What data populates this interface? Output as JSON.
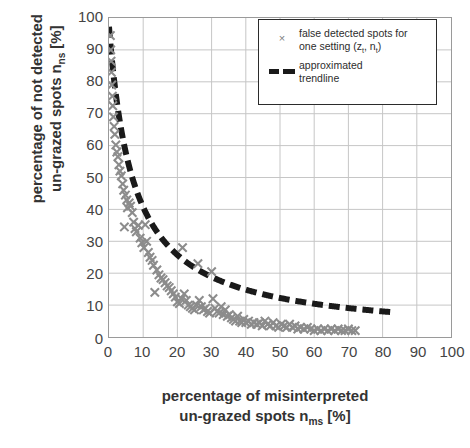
{
  "chart_data": {
    "type": "scatter",
    "title": "",
    "xlabel": "percentage of misinterpreted un-grazed spots n_ms [%]",
    "ylabel": "percentage of not detected un-grazed spots n_ns [%]",
    "xlim": [
      0,
      100
    ],
    "ylim": [
      0,
      100
    ],
    "xticks": [
      0,
      10,
      20,
      30,
      40,
      50,
      60,
      70,
      80,
      90,
      100
    ],
    "yticks": [
      0,
      10,
      20,
      30,
      40,
      50,
      60,
      70,
      80,
      90,
      100
    ],
    "grid": true,
    "legend_position": "top-right",
    "series": [
      {
        "name": "false detected spots for one setting (z_t, n_t)",
        "marker": "x",
        "color": "#8c8c8c",
        "points": [
          [
            0.4,
            94.5
          ],
          [
            0.5,
            90.0
          ],
          [
            0.6,
            86.5
          ],
          [
            0.7,
            83.0
          ],
          [
            0.8,
            79.0
          ],
          [
            1.0,
            75.5
          ],
          [
            1.1,
            72.5
          ],
          [
            1.3,
            69.0
          ],
          [
            1.5,
            66.0
          ],
          [
            1.7,
            63.5
          ],
          [
            2.0,
            60.2
          ],
          [
            2.3,
            58.0
          ],
          [
            2.6,
            56.5
          ],
          [
            2.9,
            54.0
          ],
          [
            3.2,
            52.0
          ],
          [
            3.6,
            50.5
          ],
          [
            4.0,
            48.0
          ],
          [
            4.3,
            46.0
          ],
          [
            4.8,
            44.5
          ],
          [
            5.2,
            43.0
          ],
          [
            5.4,
            40.5
          ],
          [
            5.9,
            42.0
          ],
          [
            6.3,
            41.0
          ],
          [
            6.8,
            39.0
          ],
          [
            4.5,
            34.5
          ],
          [
            7.2,
            36.0
          ],
          [
            7.6,
            34.0
          ],
          [
            8.0,
            33.0
          ],
          [
            8.6,
            35.0
          ],
          [
            9.1,
            31.0
          ],
          [
            9.6,
            29.5
          ],
          [
            10.2,
            28.0
          ],
          [
            10.6,
            35.2
          ],
          [
            11.0,
            30.0
          ],
          [
            11.5,
            26.5
          ],
          [
            12.0,
            25.0
          ],
          [
            12.6,
            24.0
          ],
          [
            13.0,
            22.5
          ],
          [
            13.4,
            14.0
          ],
          [
            14.0,
            21.0
          ],
          [
            14.6,
            19.5
          ],
          [
            15.2,
            18.5
          ],
          [
            15.8,
            18.0
          ],
          [
            16.4,
            17.0
          ],
          [
            17.0,
            16.0
          ],
          [
            17.6,
            15.5
          ],
          [
            18.2,
            14.5
          ],
          [
            18.8,
            13.5
          ],
          [
            19.4,
            12.5
          ],
          [
            20.0,
            11.0
          ],
          [
            20.6,
            10.5
          ],
          [
            21.2,
            12.0
          ],
          [
            21.5,
            28.0
          ],
          [
            22.0,
            13.5
          ],
          [
            22.6,
            11.5
          ],
          [
            23.2,
            10.0
          ],
          [
            23.8,
            9.5
          ],
          [
            24.4,
            9.0
          ],
          [
            25.0,
            8.5
          ],
          [
            25.6,
            10.0
          ],
          [
            26.0,
            23.0
          ],
          [
            26.4,
            11.5
          ],
          [
            27.0,
            9.5
          ],
          [
            27.6,
            8.5
          ],
          [
            28.2,
            9.0
          ],
          [
            28.8,
            8.0
          ],
          [
            29.4,
            7.5
          ],
          [
            30.0,
            20.5
          ],
          [
            30.4,
            12.0
          ],
          [
            31.0,
            9.0
          ],
          [
            31.6,
            8.0
          ],
          [
            32.2,
            7.5
          ],
          [
            32.8,
            9.5
          ],
          [
            33.4,
            7.0
          ],
          [
            34.0,
            8.5
          ],
          [
            34.6,
            6.5
          ],
          [
            35.2,
            7.0
          ],
          [
            35.8,
            6.0
          ],
          [
            36.4,
            5.5
          ],
          [
            37.0,
            5.0
          ],
          [
            37.6,
            6.5
          ],
          [
            38.2,
            5.0
          ],
          [
            38.8,
            4.5
          ],
          [
            39.4,
            5.5
          ],
          [
            40.0,
            4.5
          ],
          [
            40.8,
            5.0
          ],
          [
            41.6,
            4.0
          ],
          [
            42.4,
            4.5
          ],
          [
            43.2,
            4.0
          ],
          [
            44.0,
            4.5
          ],
          [
            44.8,
            3.5
          ],
          [
            45.6,
            5.0
          ],
          [
            46.4,
            4.0
          ],
          [
            47.2,
            3.5
          ],
          [
            48.0,
            4.5
          ],
          [
            48.8,
            3.5
          ],
          [
            49.6,
            3.0
          ],
          [
            50.4,
            4.0
          ],
          [
            51.2,
            3.5
          ],
          [
            52.0,
            3.0
          ],
          [
            52.8,
            4.0
          ],
          [
            53.6,
            3.0
          ],
          [
            54.4,
            3.5
          ],
          [
            55.2,
            2.5
          ],
          [
            56.0,
            3.0
          ],
          [
            57.0,
            2.5
          ],
          [
            58.0,
            3.0
          ],
          [
            59.0,
            2.5
          ],
          [
            60.0,
            2.0
          ],
          [
            61.0,
            2.5
          ],
          [
            62.0,
            2.0
          ],
          [
            63.0,
            2.5
          ],
          [
            64.0,
            2.0
          ],
          [
            65.0,
            2.5
          ],
          [
            66.0,
            2.0
          ],
          [
            67.0,
            2.5
          ],
          [
            68.0,
            2.0
          ],
          [
            69.0,
            2.0
          ],
          [
            70.0,
            2.5
          ],
          [
            71.0,
            2.0
          ],
          [
            72.0,
            2.0
          ]
        ]
      }
    ],
    "trendline": {
      "name": "approximated trendline",
      "style": "dashed",
      "color": "#1a1a1a",
      "formula": "y = 700 / (x + 7.2)",
      "x_range": [
        0,
        83
      ]
    }
  },
  "axis": {
    "y_title_line1": "percentage of not detected",
    "y_title_line2_pre": "un-grazed spots n",
    "y_title_line2_sub": "ns",
    "y_title_line2_post": " [%]",
    "x_title_line1": "percentage of misinterpreted",
    "x_title_line2_pre": "un-grazed spots n",
    "x_title_line2_sub": "ms",
    "x_title_line2_post": " [%]"
  },
  "legend": {
    "entries": [
      {
        "symbol": "×",
        "symbol_name": "x-marker",
        "line1": "false detected spots for",
        "line2_pre": "one setting (z",
        "line2_sub1": "t",
        "line2_mid": ", n",
        "line2_sub2": "t",
        "line2_post": ")"
      },
      {
        "symbol": "dashes",
        "symbol_name": "dashed-line",
        "line1": "approximated",
        "line2": "trendline"
      }
    ]
  },
  "colors": {
    "marker": "#8c8c8c",
    "trendline": "#1a1a1a",
    "grid": "#c6c6c6",
    "frame": "#9a9a9a",
    "text": "#333333"
  }
}
